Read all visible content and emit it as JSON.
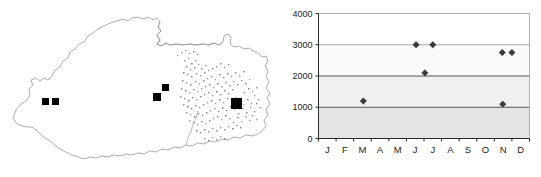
{
  "figure": {
    "panels": [
      "distribution-map",
      "seasonality-scatter"
    ]
  },
  "map": {
    "title": "",
    "region_name": "Bhutan",
    "outline_color": "#8a8a8a",
    "marker_color": "#000000",
    "stipple_color": "#8a8a8a",
    "markers": [
      {
        "id": "west-a",
        "x": 45,
        "y": 101,
        "size": 7
      },
      {
        "id": "west-b",
        "x": 55,
        "y": 101,
        "size": 7
      },
      {
        "id": "central-upper",
        "x": 165,
        "y": 87,
        "size": 7
      },
      {
        "id": "central-lower",
        "x": 157,
        "y": 97,
        "size": 8
      },
      {
        "id": "east-large",
        "x": 236,
        "y": 103,
        "size": 11
      }
    ]
  },
  "chart_data": {
    "type": "scatter",
    "title": "",
    "xlabel": "",
    "ylabel": "",
    "categories": [
      "J",
      "F",
      "M",
      "A",
      "M",
      "J",
      "J",
      "A",
      "S",
      "O",
      "N",
      "D"
    ],
    "ytick_labels": [
      "0",
      "1000",
      "2000",
      "3000",
      "4000"
    ],
    "ytick_values": [
      0,
      1000,
      2000,
      3000,
      4000
    ],
    "ylim": [
      0,
      4000
    ],
    "xlim": [
      0,
      12
    ],
    "grid": true,
    "gridlines": [
      {
        "value": 1000,
        "style": "strong"
      },
      {
        "value": 2000,
        "style": "strong"
      },
      {
        "value": 3000,
        "style": "light"
      },
      {
        "value": 4000,
        "style": "light"
      }
    ],
    "legend": null,
    "points": [
      {
        "month": "M",
        "month_index": 3,
        "x": 2.55,
        "y": 1200
      },
      {
        "month": "J",
        "month_index": 6,
        "x": 5.55,
        "y": 3000
      },
      {
        "month": "J",
        "month_index": 6,
        "x": 6.05,
        "y": 2100
      },
      {
        "month": "J",
        "month_index": 7,
        "x": 6.5,
        "y": 3000
      },
      {
        "month": "N",
        "month_index": 11,
        "x": 10.45,
        "y": 2750
      },
      {
        "month": "D",
        "month_index": 11,
        "x": 11.0,
        "y": 2750
      },
      {
        "month": "N",
        "month_index": 11,
        "x": 10.48,
        "y": 1100
      }
    ],
    "plot_background": {
      "bands": [
        {
          "from": 3000,
          "to": 4000,
          "color": "#ffffff"
        },
        {
          "from": 2000,
          "to": 3000,
          "color": "#fafafa"
        },
        {
          "from": 1000,
          "to": 2000,
          "color": "#f0f0f0"
        },
        {
          "from": 0,
          "to": 1000,
          "color": "#e4e4e4"
        }
      ]
    }
  }
}
